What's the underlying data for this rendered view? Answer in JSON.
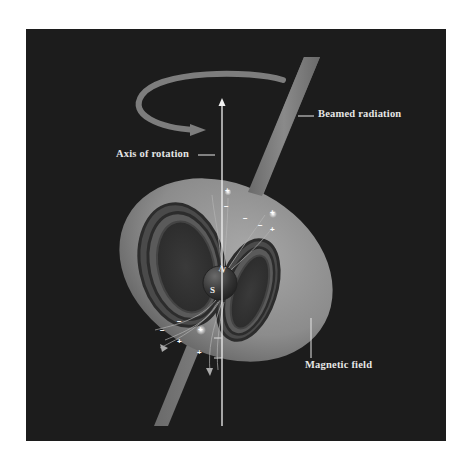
{
  "diagram": {
    "labels": {
      "beamed_radiation": "Beamed radiation",
      "axis_of_rotation": "Axis of rotation",
      "magnetic_field": "Magnetic field"
    },
    "poles": {
      "north": "N",
      "south": "S"
    },
    "charges": {
      "plus": "+",
      "minus": "−"
    },
    "colors": {
      "background": "#1c1c1c",
      "page": "#ffffff",
      "field_shell": "#8a8a8a",
      "beam": "#7a7a7a",
      "axis": "#f2f2f2",
      "text": "#e6e6e6"
    }
  }
}
